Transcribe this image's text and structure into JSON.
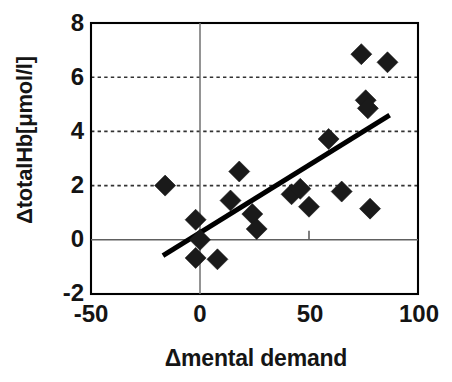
{
  "chart_data": {
    "type": "scatter",
    "title": "",
    "xlabel": "Δmental demand",
    "ylabel": "ΔtotalHb[μmol/l]",
    "xlim": [
      -50,
      100
    ],
    "ylim": [
      -2,
      8
    ],
    "xticks": [
      -50,
      0,
      50,
      100
    ],
    "xtick_labels": [
      "-50",
      "0",
      "50",
      "100"
    ],
    "yticks": [
      -2,
      0,
      2,
      4,
      6,
      8
    ],
    "ytick_labels": [
      "-2",
      "0",
      "2",
      "4",
      "6",
      "8"
    ],
    "grid": "horizontal-dotted-at-2-4-6",
    "legend": null,
    "marker": "filled-diamond",
    "marker_color": "#1a1a1a",
    "axis_color": "#000000",
    "grid_color": "#333333",
    "background": "#ffffff",
    "points": [
      {
        "x": -16,
        "y": 2.0
      },
      {
        "x": -2,
        "y": 0.74
      },
      {
        "x": 0,
        "y": 0.0
      },
      {
        "x": -2,
        "y": -0.67
      },
      {
        "x": 8,
        "y": -0.72
      },
      {
        "x": 14,
        "y": 1.45
      },
      {
        "x": 18,
        "y": 2.52
      },
      {
        "x": 24,
        "y": 0.95
      },
      {
        "x": 26,
        "y": 0.4
      },
      {
        "x": 42,
        "y": 1.68
      },
      {
        "x": 46,
        "y": 1.88
      },
      {
        "x": 50,
        "y": 1.22
      },
      {
        "x": 59,
        "y": 3.72
      },
      {
        "x": 65,
        "y": 1.78
      },
      {
        "x": 74,
        "y": 6.85
      },
      {
        "x": 76,
        "y": 5.15
      },
      {
        "x": 77,
        "y": 4.85
      },
      {
        "x": 78,
        "y": 1.15
      },
      {
        "x": 86,
        "y": 6.55
      }
    ],
    "trendline": {
      "type": "linear-fit",
      "x_start": -17,
      "y_start": -0.58,
      "x_end": 87,
      "y_end": 4.6,
      "color": "#000000",
      "width_px": 5
    },
    "zero_line_tick": {
      "x": 50,
      "note": "small tick mark on y=0 axis"
    }
  },
  "axes": {
    "y_title": "ΔtotalHb[μmol/l]",
    "x_title": "Δmental demand",
    "x_labels": [
      "-50",
      "0",
      "50",
      "100"
    ],
    "y_labels": [
      "8",
      "6",
      "4",
      "2",
      "0",
      "-2"
    ]
  }
}
